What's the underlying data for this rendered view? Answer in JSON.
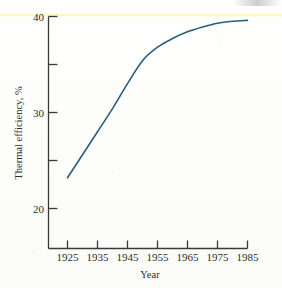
{
  "chart_data": {
    "type": "line",
    "title": "",
    "xlabel": "Year",
    "ylabel": "Thermal efficiency, %",
    "xlim": [
      1915,
      1985
    ],
    "ylim": [
      16,
      40
    ],
    "grid": false,
    "legend": "none",
    "xticks": [
      1925,
      1935,
      1945,
      1955,
      1965,
      1975,
      1985
    ],
    "xticklabels": [
      "1925",
      "1935",
      "1945",
      "1955",
      "1965",
      "1975",
      "1985"
    ],
    "yticks": [
      20,
      25,
      30,
      35,
      40
    ],
    "yticklabels": [
      "20",
      "",
      "30",
      "",
      "40"
    ],
    "ytick_labeled": [
      "20",
      "30",
      "40"
    ],
    "series": [
      {
        "name": "Thermal efficiency",
        "color": "#2a5f7a",
        "x": [
          1925,
          1930,
          1935,
          1940,
          1945,
          1950,
          1955,
          1960,
          1965,
          1970,
          1975,
          1980,
          1985
        ],
        "values": [
          23.2,
          25.6,
          28.0,
          30.4,
          33.0,
          35.4,
          36.8,
          37.7,
          38.4,
          38.9,
          39.3,
          39.5,
          39.6
        ]
      }
    ],
    "annotations": []
  },
  "axes": {
    "y_axis_label": "Thermal efficiency, %",
    "x_axis_label": "Year",
    "y_top_value": "40",
    "y_mid_value": "30",
    "y_bottom_value": "20"
  },
  "ticks": {
    "x": [
      {
        "label": "1925"
      },
      {
        "label": "1935"
      },
      {
        "label": "1945"
      },
      {
        "label": "1955"
      },
      {
        "label": "1965"
      },
      {
        "label": "1975"
      },
      {
        "label": "1985"
      }
    ],
    "y": [
      {
        "label": "40"
      },
      {
        "label": "30"
      },
      {
        "label": "20"
      }
    ]
  },
  "colors": {
    "curve": "#2a5f7a",
    "axis": "#3a3a3a",
    "text": "#2c2c2c",
    "paper": "#fdfdfb",
    "scan_streak": "#fdf8b2"
  }
}
